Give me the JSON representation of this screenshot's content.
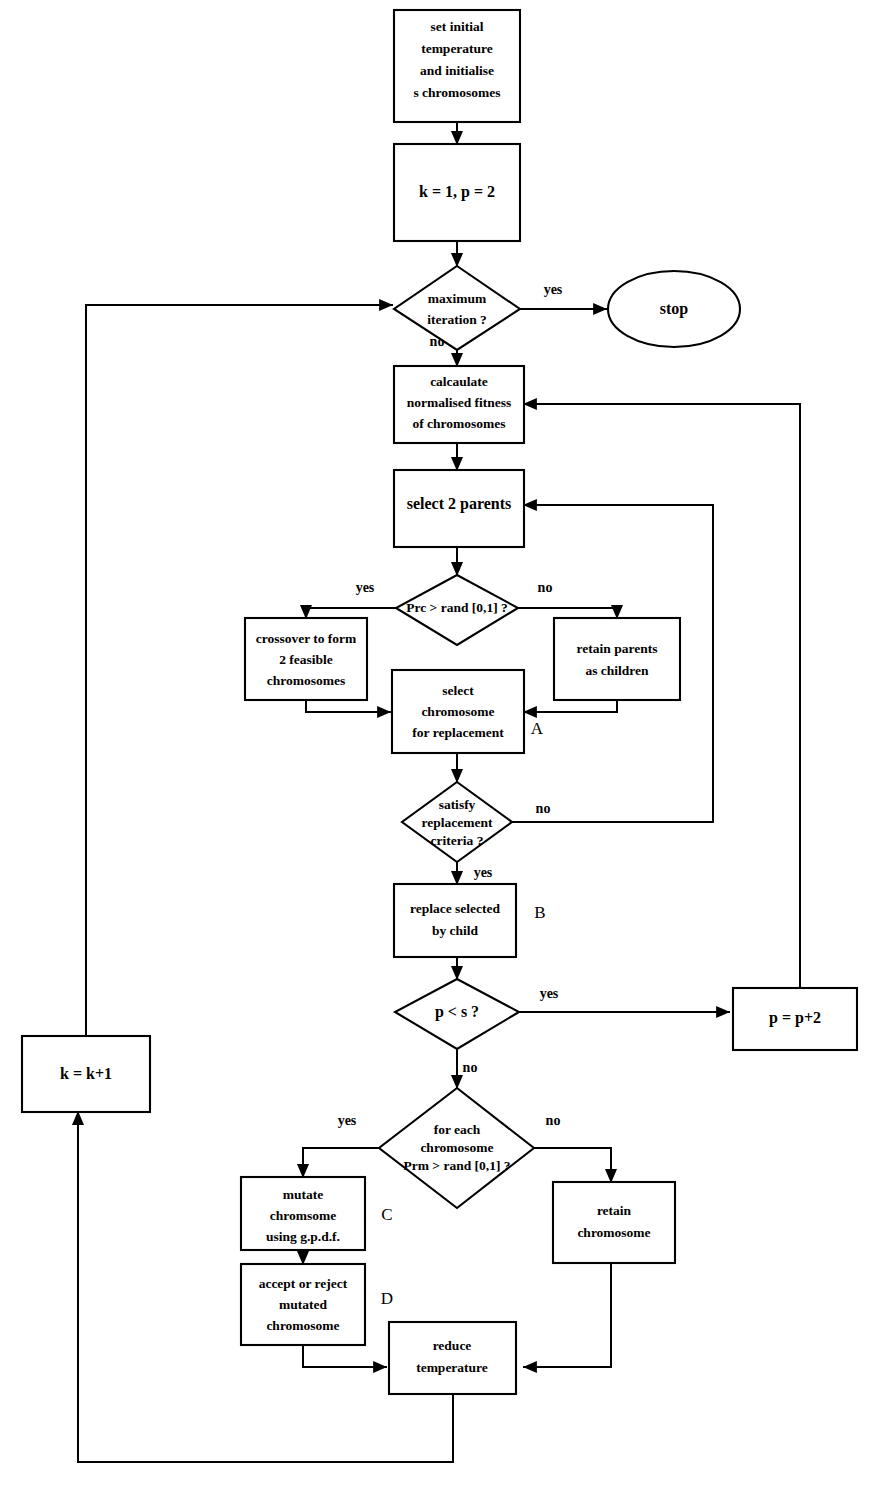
{
  "diagram": {
    "colors": {
      "stroke": "#000000",
      "fill": "#ffffff",
      "background": "#ffffff"
    },
    "nodes": {
      "start": {
        "shape": "process",
        "lines": [
          "set initial",
          "temperature",
          "and initialise",
          "s chromosomes"
        ]
      },
      "init_counters": {
        "shape": "process",
        "lines": [
          "k = 1, p = 2"
        ]
      },
      "max_iteration": {
        "shape": "decision",
        "lines": [
          "maximum",
          "iteration ?"
        ]
      },
      "stop": {
        "shape": "terminator",
        "lines": [
          "stop"
        ]
      },
      "calculate_fitness": {
        "shape": "process",
        "lines": [
          "calcaulate",
          "normalised fitness",
          "of chromosomes"
        ]
      },
      "select_parents": {
        "shape": "process",
        "lines": [
          "select 2 parents"
        ]
      },
      "crossover_test": {
        "shape": "decision",
        "lines": [
          "Prc > rand [0,1] ?"
        ]
      },
      "crossover": {
        "shape": "process",
        "lines": [
          "crossover to form",
          "2 feasible",
          "chromosomes"
        ]
      },
      "retain_parents": {
        "shape": "process",
        "lines": [
          "retain parents",
          "as children"
        ]
      },
      "select_replace": {
        "shape": "process",
        "lines": [
          "select",
          "chromosome",
          "for replacement"
        ],
        "tag": "A"
      },
      "replacement_test": {
        "shape": "decision",
        "lines": [
          "satisfy",
          "replacement",
          "criteria ?"
        ]
      },
      "replace_child": {
        "shape": "process",
        "lines": [
          "replace selected",
          "by child"
        ],
        "tag": "B"
      },
      "pop_test": {
        "shape": "decision",
        "lines": [
          "p < s ?"
        ]
      },
      "inc_p": {
        "shape": "process",
        "lines": [
          "p = p+2"
        ]
      },
      "inc_k": {
        "shape": "process",
        "lines": [
          "k = k+1"
        ]
      },
      "mutation_test": {
        "shape": "decision",
        "lines": [
          "for each",
          "chromosome",
          "Prm > rand [0,1] ?"
        ]
      },
      "mutate": {
        "shape": "process",
        "lines": [
          "mutate",
          "chromsome",
          "using g.p.d.f."
        ],
        "tag": "C"
      },
      "accept_reject": {
        "shape": "process",
        "lines": [
          "accept or reject",
          "mutated",
          "chromosome"
        ],
        "tag": "D"
      },
      "retain_chromosome": {
        "shape": "process",
        "lines": [
          "retain",
          "chromosome"
        ]
      },
      "reduce_temperature": {
        "shape": "process",
        "lines": [
          "reduce",
          "temperature"
        ]
      }
    },
    "edge_labels": {
      "max_iteration_yes": "yes",
      "max_iteration_no": "no",
      "crossover_yes": "yes",
      "crossover_no": "no",
      "replacement_no": "no",
      "replacement_yes": "yes",
      "pop_test_yes": "yes",
      "pop_test_no": "no",
      "mutation_yes": "yes",
      "mutation_no": "no"
    },
    "tags": {
      "a": "A",
      "b": "B",
      "c": "C",
      "d": "D"
    }
  }
}
